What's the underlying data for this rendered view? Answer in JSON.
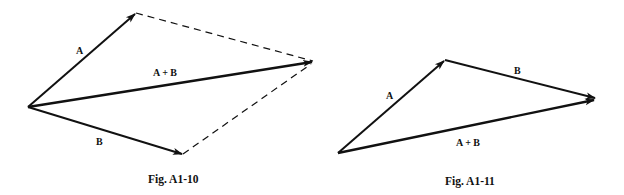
{
  "figures": [
    {
      "caption": "Fig. A1-10",
      "method": "parallelogram",
      "labels": {
        "a": "A",
        "b": "B",
        "sum": "A + B"
      }
    },
    {
      "caption": "Fig. A1-11",
      "method": "triangle",
      "labels": {
        "a": "A",
        "b": "B",
        "sum": "A + B"
      }
    }
  ],
  "colors": {
    "stroke": "#111111",
    "background": "#ffffff"
  }
}
